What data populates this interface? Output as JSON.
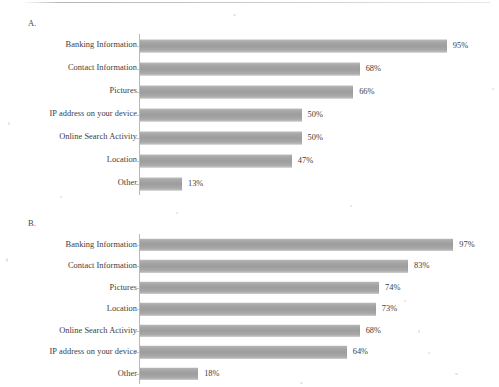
{
  "figure": {
    "panels": [
      {
        "letter": "A."
      },
      {
        "letter": "B."
      }
    ]
  },
  "chart_data": [
    {
      "type": "bar",
      "orientation": "horizontal",
      "panel": "A.",
      "title": "",
      "xlabel": "",
      "ylabel": "",
      "xlim": [
        0,
        100
      ],
      "grid": false,
      "legend": false,
      "value_suffix": "%",
      "categories": [
        "Banking Information",
        "Contact Information",
        "Pictures",
        "IP address on your device",
        "Online Search Activity",
        "Location",
        "Other"
      ],
      "values": [
        95,
        68,
        66,
        50,
        50,
        47,
        13
      ],
      "labels": [
        "95%",
        "68%",
        "66%",
        "50%",
        "50%",
        "47%",
        "13%"
      ],
      "bar_color": "#a5a5a5"
    },
    {
      "type": "bar",
      "orientation": "horizontal",
      "panel": "B.",
      "title": "",
      "xlabel": "",
      "ylabel": "",
      "xlim": [
        0,
        100
      ],
      "grid": false,
      "legend": false,
      "value_suffix": "%",
      "categories": [
        "Banking Information",
        "Contact Information",
        "Pictures",
        "Location",
        "Online Search Activity",
        "IP address on your device",
        "Other"
      ],
      "values": [
        97,
        83,
        74,
        73,
        68,
        64,
        18
      ],
      "labels": [
        "97%",
        "83%",
        "74%",
        "73%",
        "68%",
        "64%",
        "18%"
      ],
      "bar_color": "#a5a5a5"
    }
  ]
}
